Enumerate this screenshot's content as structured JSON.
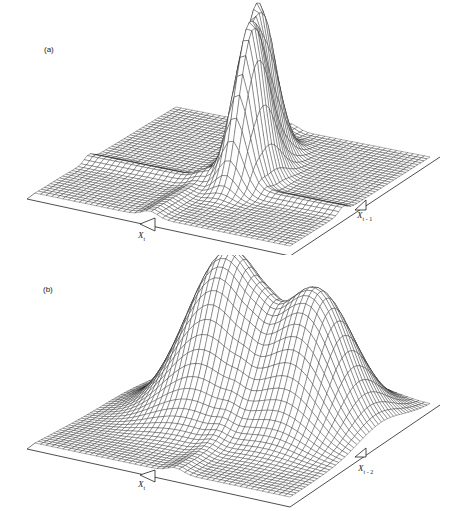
{
  "figure": {
    "panels": [
      {
        "label": "(a)",
        "axis_labels": [
          {
            "name": "X",
            "sub": "t"
          },
          {
            "name": "X",
            "sub": "t - 1"
          }
        ],
        "peaks": [
          {
            "u": 0.52,
            "v": 0.35,
            "height": 150,
            "sx": 0.045,
            "sy": 0.09
          },
          {
            "u": 0.58,
            "v": 0.52,
            "height": 145,
            "sx": 0.045,
            "sy": 0.09
          }
        ],
        "ridges": [
          {
            "dir": "u",
            "at": 0.45,
            "depth": 6,
            "w": 0.03
          },
          {
            "dir": "v",
            "at": 0.62,
            "depth": 6,
            "w": 0.03
          }
        ]
      },
      {
        "label": "(b)",
        "axis_labels": [
          {
            "name": "X",
            "sub": "t"
          },
          {
            "name": "X",
            "sub": "t - 2"
          }
        ],
        "peaks": [
          {
            "u": 0.4,
            "v": 0.35,
            "height": 160,
            "sx": 0.14,
            "sy": 0.16
          },
          {
            "u": 0.75,
            "v": 0.35,
            "height": 130,
            "sx": 0.12,
            "sy": 0.16
          }
        ],
        "ridges": [
          {
            "dir": "u",
            "at": 0.55,
            "depth": 5,
            "w": 0.03
          }
        ]
      }
    ]
  },
  "chart_data": [
    {
      "type": "surface",
      "title": "(a)",
      "xlabel": "X_t",
      "ylabel": "X_{t-1}",
      "description": "Wireframe 3D surface showing two narrow, tall peaks near the centre of the grid",
      "peaks": [
        {
          "label": "peak 1",
          "relative_height": 1.0
        },
        {
          "label": "peak 2",
          "relative_height": 0.95
        }
      ],
      "grid": true
    },
    {
      "type": "surface",
      "title": "(b)",
      "xlabel": "X_t",
      "ylabel": "X_{t-2}",
      "description": "Wireframe 3D surface showing two broad, smooth peaks of roughly equal height",
      "peaks": [
        {
          "label": "peak 1",
          "relative_height": 1.0
        },
        {
          "label": "peak 2",
          "relative_height": 1.0
        }
      ],
      "grid": true
    }
  ]
}
